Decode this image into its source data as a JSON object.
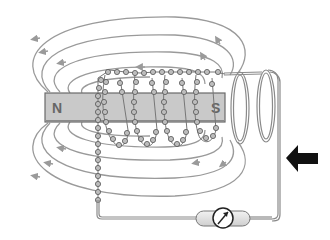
{
  "diagram": {
    "magnet": {
      "north_label": "N",
      "south_label": "S",
      "fill": "#c9c9c9",
      "stroke": "#6a6a6a"
    },
    "field_lines": {
      "color": "#9a9a9a",
      "count_top": 5,
      "count_bottom": 5
    },
    "coil": {
      "bead_fill": "#bdbdbd",
      "bead_stroke": "#555555",
      "loops_right": 2
    },
    "wire": {
      "color": "#8a8a8a"
    },
    "galvanometer": {
      "symbol": "meter-with-arrow",
      "fill": "#e6e6e6"
    },
    "motion_arrow": {
      "direction": "left",
      "color": "#111111"
    }
  }
}
